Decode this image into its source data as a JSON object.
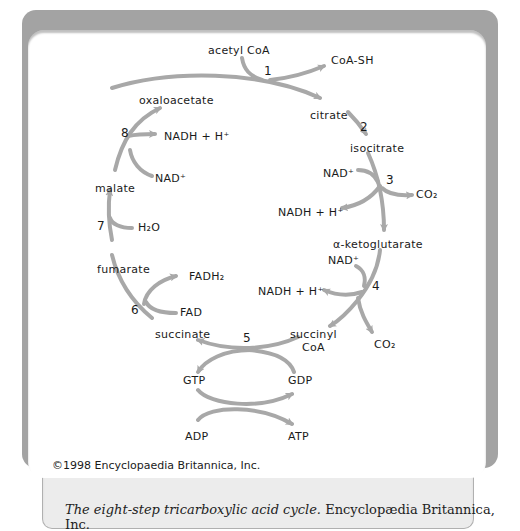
{
  "figure": {
    "title": "The eight-step tricarboxylic acid cycle.",
    "caption_credit": "Encyclopædia Britannica, Inc.",
    "copyright": "©1998 Encyclopaedia Britannica, Inc.",
    "colors": {
      "frame": "#a3a3a3",
      "arrow": "#a8a8a8",
      "caption_bg": "#ececec",
      "text": "#1a1a1a"
    }
  },
  "diagram": {
    "metabolites": {
      "acetyl_coa": "acetyl CoA",
      "coa_sh": "CoA-SH",
      "citrate": "citrate",
      "isocitrate": "isocitrate",
      "alpha_ketoglutarate": "α-ketoglutarate",
      "succinyl_coa_line1": "succinyl",
      "succinyl_coa_line2": "CoA",
      "succinate": "succinate",
      "fumarate": "fumarate",
      "malate": "malate",
      "oxaloacetate": "oxaloacetate"
    },
    "cofactors": {
      "step3_nad": "NAD⁺",
      "step3_nadh": "NADH + H⁺",
      "step3_co2": "CO₂",
      "step4_nad": "NAD⁺",
      "step4_nadh": "NADH + H⁺",
      "step4_co2": "CO₂",
      "step5_gtp": "GTP",
      "step5_gdp": "GDP",
      "step5_adp": "ADP",
      "step5_atp": "ATP",
      "step6_fad": "FAD",
      "step6_fadh2": "FADH₂",
      "step7_h2o": "H₂O",
      "step8_nad": "NAD⁺",
      "step8_nadh": "NADH + H⁺"
    },
    "steps": [
      "1",
      "2",
      "3",
      "4",
      "5",
      "6",
      "7",
      "8"
    ]
  }
}
